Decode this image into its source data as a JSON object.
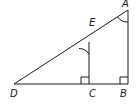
{
  "diagram": {
    "type": "geometry",
    "points": {
      "A": {
        "label": "A",
        "x": 128,
        "y": 10
      },
      "B": {
        "label": "B",
        "x": 128,
        "y": 84
      },
      "C": {
        "label": "C",
        "x": 89,
        "y": 84
      },
      "D": {
        "label": "D",
        "x": 14,
        "y": 84
      },
      "E": {
        "label": "E",
        "x": 89,
        "y": 42
      }
    },
    "segments": [
      "DA",
      "DB",
      "AB",
      "EC"
    ],
    "right_angles": [
      "C",
      "B"
    ],
    "marked_angles": [
      "A",
      "E"
    ],
    "stroke_color": "#1a1a1a"
  }
}
